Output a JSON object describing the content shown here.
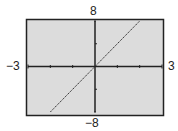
{
  "chart_data": {
    "type": "line",
    "title": "",
    "xlabel": "",
    "ylabel": "",
    "xlim": [
      -3,
      3
    ],
    "ylim": [
      -8,
      8
    ],
    "x_tick_labels": {
      "left": "−3",
      "right": "3"
    },
    "y_tick_labels": {
      "top": "8",
      "bottom": "−8"
    },
    "x_ticks": [
      -2,
      -1,
      1,
      2
    ],
    "y_ticks": [
      -4,
      4
    ],
    "grid": false,
    "series": [
      {
        "name": "y = 4x",
        "x": [
          -2,
          -1,
          0,
          1,
          2
        ],
        "y": [
          -8,
          -4,
          0,
          4,
          8
        ]
      }
    ],
    "colors": {
      "background": "#dcdcdc",
      "frame": "#222222",
      "line": "#333333"
    }
  }
}
